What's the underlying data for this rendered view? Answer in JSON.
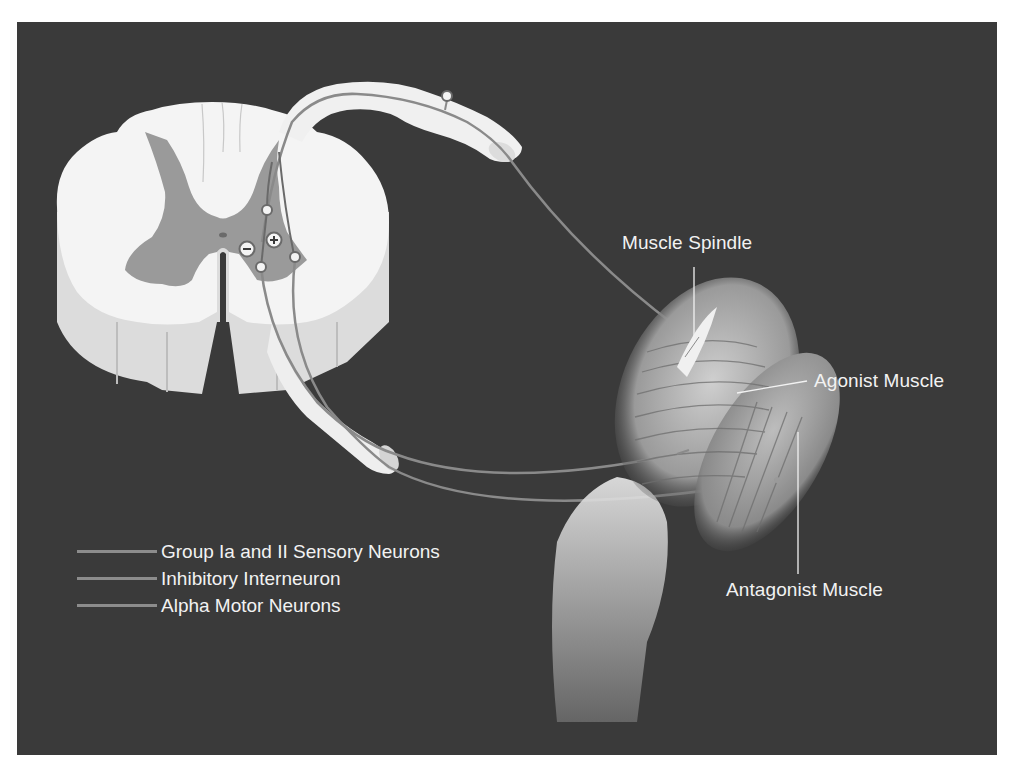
{
  "figure": {
    "background_color": "#3a3a3a",
    "structure_color": "#f4f4f4",
    "grey_matter_color": "#9a9a9a",
    "nerve_color": "#8a8a8a"
  },
  "labels": {
    "muscle_spindle": "Muscle Spindle",
    "agonist_muscle": "Agonist Muscle",
    "antagonist_muscle": "Antagonist Muscle"
  },
  "synapse_symbols": {
    "inhibitory": "−",
    "excitatory": "+"
  },
  "legend": {
    "items": [
      {
        "label": "Group Ia and II Sensory Neurons",
        "color": "#8c8c8c"
      },
      {
        "label": "Inhibitory Interneuron",
        "color": "#8c8c8c"
      },
      {
        "label": "Alpha Motor Neurons",
        "color": "#8c8c8c"
      }
    ]
  }
}
